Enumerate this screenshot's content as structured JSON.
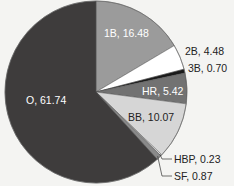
{
  "chart_data": {
    "type": "pie",
    "title": "",
    "start_angle": "12 o'clock",
    "direction": "clockwise",
    "slices": [
      {
        "label": "1B",
        "value": 16.48,
        "color": "#9b9b9b",
        "text": "1B, 16.48",
        "text_color": "#ffffff"
      },
      {
        "label": "2B",
        "value": 4.48,
        "color": "#ffffff",
        "text": "2B, 4.48",
        "text_color": "#222222"
      },
      {
        "label": "3B",
        "value": 0.7,
        "color": "#1a1a1a",
        "text": "3B, 0.70",
        "text_color": "#222222"
      },
      {
        "label": "HR",
        "value": 5.42,
        "color": "#727272",
        "text": "HR, 5.42",
        "text_color": "#ffffff"
      },
      {
        "label": "BB",
        "value": 10.07,
        "color": "#d6d6d6",
        "text": "BB, 10.07",
        "text_color": "#222222"
      },
      {
        "label": "HBP",
        "value": 0.23,
        "color": "#f2f2f2",
        "text": "HBP, 0.23",
        "text_color": "#222222"
      },
      {
        "label": "SF",
        "value": 0.87,
        "color": "#8a8a8a",
        "text": "SF, 0.87",
        "text_color": "#222222"
      },
      {
        "label": "O",
        "value": 61.74,
        "color": "#3e3c3c",
        "text": "O, 61.74",
        "text_color": "#ffffff"
      }
    ],
    "legend": "none (inline labels)"
  }
}
